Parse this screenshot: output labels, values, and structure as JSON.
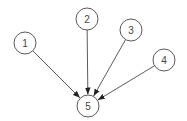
{
  "diagram": {
    "type": "directed-graph",
    "colors": {
      "stroke": "#5a5a5a",
      "edge": "#4a4a4a",
      "arrowhead": "#222222",
      "label": "#444444",
      "background": "#ffffff"
    },
    "nodes": [
      {
        "id": "1",
        "label": "1",
        "cx": 25,
        "cy": 43,
        "r": 11
      },
      {
        "id": "2",
        "label": "2",
        "cx": 87,
        "cy": 19,
        "r": 11
      },
      {
        "id": "3",
        "label": "3",
        "cx": 131,
        "cy": 30,
        "r": 11
      },
      {
        "id": "4",
        "label": "4",
        "cx": 164,
        "cy": 60,
        "r": 11
      },
      {
        "id": "5",
        "label": "5",
        "cx": 88,
        "cy": 106,
        "r": 11
      }
    ],
    "edges": [
      {
        "from": "1",
        "to": "5"
      },
      {
        "from": "2",
        "to": "5"
      },
      {
        "from": "3",
        "to": "5"
      },
      {
        "from": "4",
        "to": "5"
      }
    ]
  }
}
